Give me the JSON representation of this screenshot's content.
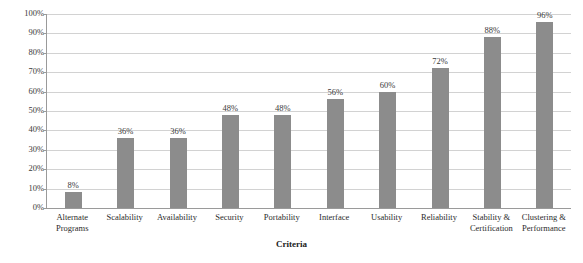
{
  "chart_data": {
    "type": "bar",
    "title": "",
    "subtitle": "",
    "xlabel": "Criteria",
    "ylabel": "",
    "categories": [
      "Alternate Programs",
      "Scalability",
      "Availability",
      "Security",
      "Portability",
      "Interface",
      "Usability",
      "Reliability",
      "Stability & Certification",
      "Clustering & Performance"
    ],
    "values": [
      8,
      36,
      36,
      48,
      48,
      56,
      60,
      72,
      88,
      96
    ],
    "value_labels": [
      "8%",
      "36%",
      "36%",
      "48%",
      "48%",
      "56%",
      "60%",
      "72%",
      "88%",
      "96%"
    ],
    "ylim": [
      0,
      100
    ],
    "ytick_values": [
      0,
      10,
      20,
      30,
      40,
      50,
      60,
      70,
      80,
      90,
      100
    ],
    "ytick_labels": [
      "0%",
      "10%",
      "20%",
      "30%",
      "40%",
      "50%",
      "60%",
      "70%",
      "80%",
      "90%",
      "100%"
    ],
    "grid": true,
    "legend": false,
    "legend_position": "none",
    "bar_color": "#8c8c8c",
    "gridline_color": "#d2d2d2",
    "axis_color": "#9a9a9a",
    "background_color": "#ffffff",
    "text_color": "#2b2b2b"
  }
}
